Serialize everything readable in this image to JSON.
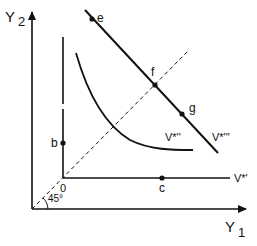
{
  "axes": {
    "y_label": "Y",
    "y_sub": "2",
    "x_label": "Y",
    "x_sub": "1",
    "origin_label": "0",
    "angle_label": "45°"
  },
  "points": {
    "e": "e",
    "f": "f",
    "g": "g",
    "b": "b",
    "c": "c"
  },
  "curves": {
    "v1": "V*'",
    "v2": "V*''",
    "v3": "V*'''"
  },
  "colors": {
    "ink": "#111111",
    "background": "#ffffff"
  }
}
